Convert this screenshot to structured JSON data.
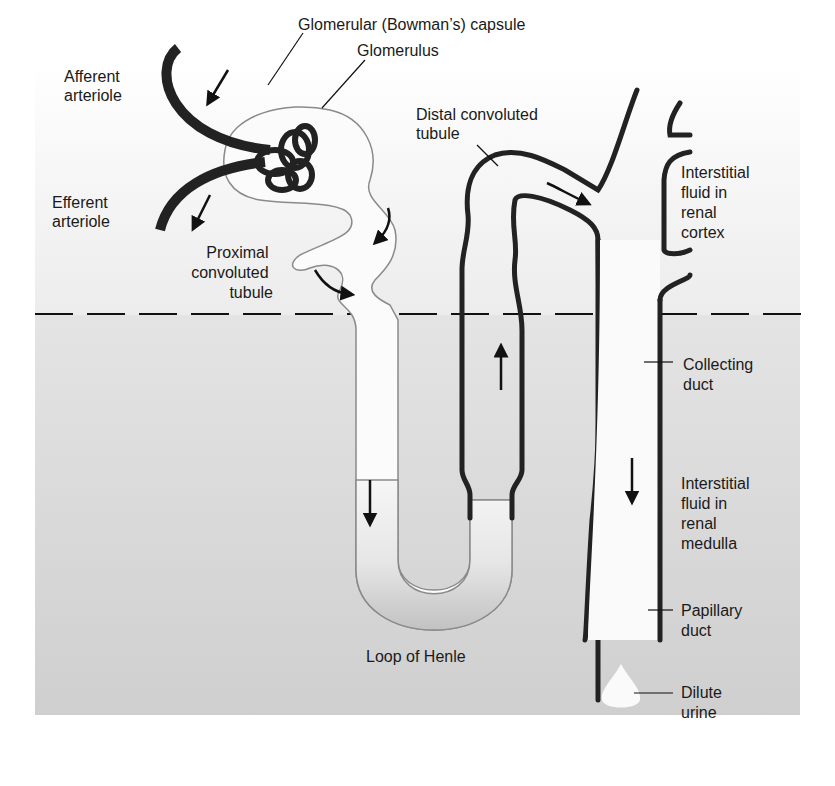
{
  "diagram": {
    "regions": {
      "cortex": {
        "label_lines": [
          "Interstitial",
          "fluid in",
          "renal",
          "cortex"
        ]
      },
      "medulla": {
        "label_lines": [
          "Interstitial",
          "fluid in",
          "renal",
          "medulla"
        ]
      }
    },
    "labels": {
      "afferent_arteriole": [
        "Afferent",
        "arteriole"
      ],
      "efferent_arteriole": [
        "Efferent",
        "arteriole"
      ],
      "bowmans_capsule": "Glomerular (Bowman’s) capsule",
      "glomerulus": "Glomerulus",
      "proximal_tubule": [
        "Proximal",
        "convoluted",
        "tubule"
      ],
      "distal_tubule": [
        "Distal convoluted",
        "tubule"
      ],
      "collecting_duct": [
        "Collecting",
        "duct"
      ],
      "papillary_duct": [
        "Papillary",
        "duct"
      ],
      "loop_of_henle": "Loop of Henle",
      "dilute_urine": [
        "Dilute",
        "urine"
      ]
    },
    "colors": {
      "cortex_bg": "#f2f2f2",
      "medulla_bg": "#d4d4d4",
      "tubule_fill": "#fafafa",
      "loop_fill": "#c6c6c6",
      "vessel": "#222222",
      "thin_wall": "#8a8a8a"
    }
  }
}
